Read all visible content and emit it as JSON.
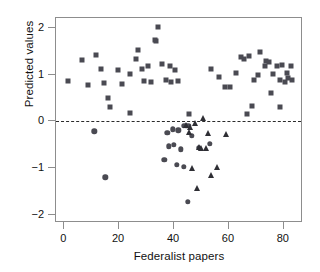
{
  "chart_data": {
    "type": "scatter",
    "title": "",
    "xlabel": "Federalist papers",
    "ylabel": "Predicted values",
    "xlim": [
      -3,
      87
    ],
    "ylim": [
      -2.18,
      2.22
    ],
    "xticks": [
      0,
      20,
      40,
      60,
      80
    ],
    "yticks": [
      2,
      1,
      0,
      -1,
      -2
    ],
    "xticklabels": [
      "0",
      "20",
      "40",
      "60",
      "80"
    ],
    "yticklabels": [
      "2",
      "1",
      "0",
      "−1",
      "−2"
    ],
    "grid": false,
    "legend": null,
    "annotations": [
      {
        "type": "hline",
        "y": 0,
        "style": "dashed",
        "color": "#2b2b2b"
      }
    ],
    "series": [
      {
        "name": "squares",
        "marker": "square",
        "color": "#4a4a52",
        "points": [
          [
            1.5,
            0.86
          ],
          [
            6.5,
            1.32
          ],
          [
            8.5,
            0.79
          ],
          [
            11.5,
            1.43
          ],
          [
            13.5,
            1.12
          ],
          [
            14.5,
            0.82
          ],
          [
            16.5,
            0.31
          ],
          [
            16.0,
            0.5
          ],
          [
            19.5,
            1.1
          ],
          [
            21.0,
            0.8
          ],
          [
            24.0,
            1.01
          ],
          [
            26.0,
            1.33
          ],
          [
            27.0,
            1.53
          ],
          [
            28.5,
            1.12
          ],
          [
            29.0,
            0.86
          ],
          [
            30.5,
            1.18
          ],
          [
            31.5,
            0.85
          ],
          [
            33.0,
            1.75
          ],
          [
            33.5,
            1.73
          ],
          [
            34.0,
            2.02
          ],
          [
            35.5,
            1.24
          ],
          [
            37.0,
            0.88
          ],
          [
            38.5,
            1.18
          ],
          [
            39.0,
            0.84
          ],
          [
            40.5,
            1.11
          ],
          [
            41.5,
            0.86
          ],
          [
            24.0,
            0.19
          ],
          [
            45.5,
            0.16
          ],
          [
            58.5,
            0.73
          ],
          [
            60.5,
            0.74
          ],
          [
            62.5,
            1.05
          ],
          [
            64.5,
            1.38
          ],
          [
            65.5,
            1.34
          ],
          [
            67.5,
            1.4
          ],
          [
            69.0,
            0.88
          ],
          [
            70.5,
            1.0
          ],
          [
            71.5,
            1.5
          ],
          [
            73.0,
            1.2
          ],
          [
            73.5,
            1.29
          ],
          [
            74.5,
            1.27
          ],
          [
            75.5,
            0.62
          ],
          [
            76.0,
            1.02
          ],
          [
            77.5,
            1.18
          ],
          [
            78.5,
            0.89
          ],
          [
            79.5,
            1.22
          ],
          [
            80.5,
            0.85
          ],
          [
            81.0,
            1.03
          ],
          [
            81.5,
            0.93
          ],
          [
            82.5,
            1.2
          ],
          [
            83.0,
            0.88
          ],
          [
            68.5,
            0.34
          ],
          [
            78.5,
            0.3
          ],
          [
            66.5,
            0.15
          ],
          [
            56.5,
            0.96
          ],
          [
            53.5,
            1.12
          ]
        ]
      },
      {
        "name": "circles",
        "marker": "circle",
        "color": "#4a4a52",
        "points": [
          [
            11.0,
            -0.21
          ],
          [
            15.0,
            -1.2
          ],
          [
            37.5,
            -0.25
          ],
          [
            39.5,
            -0.17
          ],
          [
            41.5,
            -0.19
          ],
          [
            43.5,
            -0.09
          ],
          [
            44.5,
            -0.09
          ],
          [
            45.5,
            -0.1
          ],
          [
            46.5,
            -0.31
          ],
          [
            38.0,
            -0.53
          ],
          [
            40.0,
            -0.5
          ],
          [
            42.5,
            -0.6
          ],
          [
            36.5,
            -0.82
          ],
          [
            41.0,
            -0.93
          ],
          [
            43.5,
            -0.97
          ],
          [
            49.0,
            -0.56
          ],
          [
            53.0,
            -0.48
          ],
          [
            45.0,
            -1.72
          ]
        ]
      },
      {
        "name": "triangles",
        "marker": "triangle",
        "color": "#2e2e34",
        "points": [
          [
            50.5,
            0.07
          ],
          [
            47.5,
            -0.04
          ],
          [
            44.5,
            -0.08
          ],
          [
            46.0,
            -0.11
          ],
          [
            52.5,
            -0.25
          ],
          [
            59.0,
            -0.26
          ],
          [
            49.0,
            -0.55
          ],
          [
            50.0,
            -0.56
          ],
          [
            51.5,
            -0.56
          ],
          [
            55.5,
            -0.98
          ],
          [
            46.5,
            -1.0
          ],
          [
            53.5,
            -1.15
          ],
          [
            48.5,
            -1.42
          ],
          [
            45.5,
            -0.23
          ]
        ]
      }
    ]
  }
}
